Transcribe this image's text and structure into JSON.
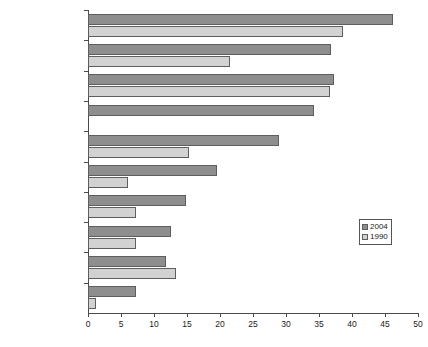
{
  "chart_data": {
    "type": "bar",
    "orientation": "horizontal",
    "title": "",
    "xlabel": "",
    "ylabel": "",
    "xlim": [
      0,
      50
    ],
    "xticks": [
      0,
      5,
      10,
      15,
      20,
      25,
      30,
      35,
      40,
      45,
      50
    ],
    "grid": false,
    "legend_position": "right",
    "categories": [
      "Sweden",
      "Netherlands",
      "Norway",
      "Germany",
      "Spain",
      "United Kingdom",
      "United States",
      "France",
      "Italy",
      "Japan"
    ],
    "series": [
      {
        "name": "2004",
        "color": "#8e8e8e",
        "values": [
          46.2,
          36.8,
          37.2,
          34.2,
          29.0,
          19.5,
          14.8,
          12.5,
          11.8,
          7.3
        ]
      },
      {
        "name": "1990",
        "color": "#d2d2d2",
        "values": [
          38.6,
          21.5,
          36.6,
          0.0,
          15.3,
          6.0,
          7.2,
          7.2,
          13.4,
          1.2
        ]
      }
    ]
  },
  "legend": {
    "items": [
      {
        "label": "2004",
        "color": "#8e8e8e"
      },
      {
        "label": "1990",
        "color": "#d2d2d2"
      }
    ]
  },
  "colors": {
    "series_2004": "#8e8e8e",
    "series_1990": "#d2d2d2",
    "axis": "#4a4a4a",
    "bar_border": "#5e5e5e",
    "background": "#ffffff",
    "text": "#1a1a1a"
  }
}
